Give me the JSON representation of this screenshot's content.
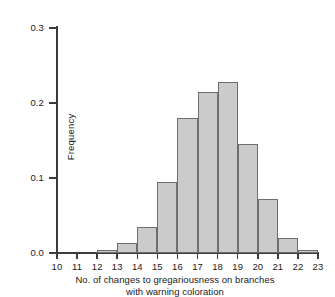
{
  "chart_data": {
    "type": "bar",
    "title": "",
    "subtitle": "",
    "xlabel_line1": "No. of changes to gregariousness on branches",
    "xlabel_line2": "with warning coloration",
    "ylabel": "Frequency",
    "categories": [
      "10",
      "11",
      "12",
      "13",
      "14",
      "15",
      "16",
      "17",
      "18",
      "19",
      "20",
      "21",
      "22",
      "23"
    ],
    "values": [
      0.0,
      0.0,
      0.004,
      0.014,
      0.035,
      0.095,
      0.18,
      0.215,
      0.228,
      0.145,
      0.072,
      0.02,
      0.004,
      0.0
    ],
    "xlim": [
      10,
      23
    ],
    "ylim": [
      0.0,
      0.3
    ],
    "ytick_labels": [
      "0.0",
      "0.1",
      "0.2",
      "0.3"
    ],
    "ytick_values": [
      0.0,
      0.1,
      0.2,
      0.3
    ],
    "xtick_labels": [
      "10",
      "11",
      "12",
      "13",
      "14",
      "15",
      "16",
      "17",
      "18",
      "19",
      "20",
      "21",
      "22",
      "23"
    ],
    "grid": false,
    "legend": null,
    "bar_fill_color": "#cbcbcb",
    "bar_edge_color": "#6e6e6e",
    "axis_color": "#3c3c3c",
    "background_color": "#ffffff"
  }
}
